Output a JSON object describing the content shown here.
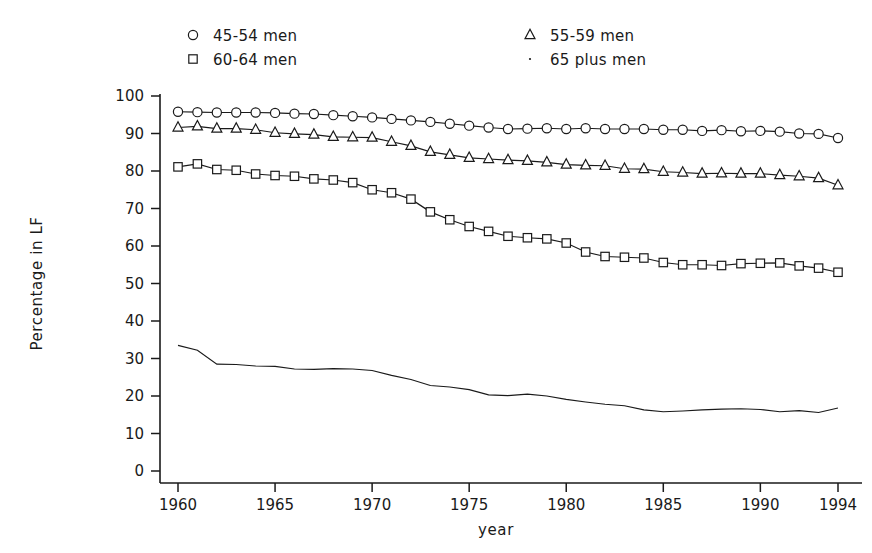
{
  "chart_data": {
    "type": "line",
    "title": "",
    "xlabel": "year",
    "ylabel": "Percentage in LF",
    "xlim": [
      1960,
      1994
    ],
    "ylim": [
      0,
      100
    ],
    "grid": false,
    "legend_position": "top",
    "xticks": [
      "1960",
      "1965",
      "1970",
      "1975",
      "1980",
      "1985",
      "1990",
      "1994"
    ],
    "xtick_values": [
      1960,
      1965,
      1970,
      1975,
      1980,
      1985,
      1990,
      1994
    ],
    "yticks": [
      "0",
      "10",
      "20",
      "30",
      "40",
      "50",
      "60",
      "70",
      "80",
      "90",
      "100"
    ],
    "ytick_values": [
      0,
      10,
      20,
      30,
      40,
      50,
      60,
      70,
      80,
      90,
      100
    ],
    "x": [
      1960,
      1961,
      1962,
      1963,
      1964,
      1965,
      1966,
      1967,
      1968,
      1969,
      1970,
      1971,
      1972,
      1973,
      1974,
      1975,
      1976,
      1977,
      1978,
      1979,
      1980,
      1981,
      1982,
      1983,
      1984,
      1985,
      1986,
      1987,
      1988,
      1989,
      1990,
      1991,
      1992,
      1993,
      1994
    ],
    "series": [
      {
        "name": "45-54 men",
        "marker": "circle",
        "values": [
          95.8,
          95.7,
          95.6,
          95.6,
          95.6,
          95.5,
          95.3,
          95.2,
          94.9,
          94.6,
          94.3,
          93.9,
          93.5,
          93.1,
          92.6,
          92.1,
          91.6,
          91.2,
          91.3,
          91.4,
          91.2,
          91.4,
          91.2,
          91.2,
          91.2,
          91.0,
          91.0,
          90.7,
          90.9,
          90.6,
          90.7,
          90.5,
          90.0,
          89.9,
          88.8
        ]
      },
      {
        "name": "55-59 men",
        "marker": "triangle",
        "values": [
          91.6,
          91.9,
          91.3,
          91.3,
          91.0,
          90.2,
          89.9,
          89.7,
          89.1,
          89.0,
          88.9,
          87.8,
          86.7,
          85.1,
          84.3,
          83.5,
          83.2,
          82.9,
          82.7,
          82.3,
          81.7,
          81.5,
          81.4,
          80.6,
          80.5,
          79.8,
          79.6,
          79.3,
          79.4,
          79.3,
          79.3,
          78.9,
          78.6,
          78.1,
          76.2
        ]
      },
      {
        "name": "60-64 men",
        "marker": "square",
        "values": [
          81.1,
          81.9,
          80.4,
          80.2,
          79.2,
          78.8,
          78.6,
          77.9,
          77.6,
          76.9,
          75.0,
          74.2,
          72.5,
          69.1,
          67.0,
          65.2,
          63.9,
          62.6,
          62.2,
          61.9,
          60.8,
          58.4,
          57.2,
          57.0,
          56.8,
          55.6,
          55.0,
          55.0,
          54.8,
          55.3,
          55.4,
          55.5,
          54.7,
          54.1,
          53.0
        ]
      },
      {
        "name": "65 plus men",
        "marker": "none",
        "values": [
          33.5,
          32.2,
          28.5,
          28.4,
          28.0,
          27.9,
          27.2,
          27.1,
          27.3,
          27.2,
          26.8,
          25.5,
          24.4,
          22.8,
          22.4,
          21.7,
          20.3,
          20.1,
          20.5,
          20.0,
          19.1,
          18.4,
          17.8,
          17.4,
          16.3,
          15.8,
          16.0,
          16.3,
          16.5,
          16.6,
          16.4,
          15.8,
          16.1,
          15.6,
          16.8
        ]
      }
    ]
  },
  "legend": {
    "entries": [
      {
        "marker": "circle",
        "label": "45-54 men"
      },
      {
        "marker": "triangle",
        "label": "55-59 men"
      },
      {
        "marker": "square",
        "label": "60-64 men"
      },
      {
        "marker": "dot",
        "label": "65 plus men"
      }
    ]
  },
  "colors": {
    "ink": "#1a1a1a",
    "background": "#ffffff"
  }
}
